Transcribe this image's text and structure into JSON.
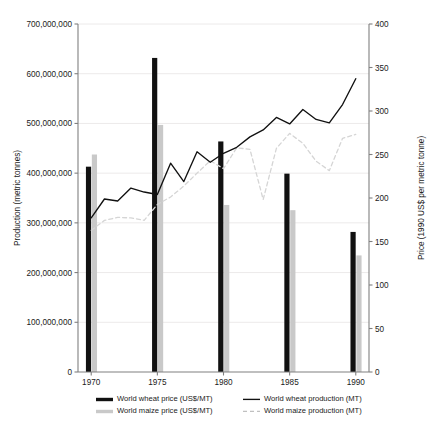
{
  "chart_data": {
    "type": "line",
    "title": "",
    "xlabel": "",
    "ylabel": "Production (metric tonnes)",
    "y2label": "Price (1990 US$ per metric tonne)",
    "xlim": [
      1969,
      1991
    ],
    "ylim": [
      0,
      700000000
    ],
    "y2lim": [
      0,
      400
    ],
    "grid": true,
    "legend_position": "bottom",
    "x_ticks": [
      1970,
      1975,
      1980,
      1985,
      1990
    ],
    "x_tick_labels": [
      "1970",
      "1975",
      "1980",
      "1985",
      "1990"
    ],
    "y_ticks": [
      0,
      100000000,
      200000000,
      300000000,
      400000000,
      500000000,
      600000000,
      700000000
    ],
    "y_tick_labels": [
      "0",
      "100,000,000",
      "200,000,000",
      "300,000,000",
      "400,000,000",
      "500,000,000",
      "600,000,000",
      "700,000,000"
    ],
    "y2_ticks": [
      0,
      50,
      100,
      150,
      200,
      250,
      300,
      350,
      400
    ],
    "y2_tick_labels": [
      "0",
      "50",
      "100",
      "150",
      "200",
      "250",
      "300",
      "350",
      "400"
    ],
    "series": [
      {
        "name": "World wheat price (US$/MT)",
        "type": "bar",
        "axis": "right",
        "color": "#111111",
        "x": [
          1970,
          1975,
          1980,
          1985,
          1990
        ],
        "values": [
          236,
          361,
          265,
          228,
          161
        ]
      },
      {
        "name": "World maize price (US$/MT)",
        "type": "bar",
        "axis": "right",
        "color": "#c9c9c9",
        "x": [
          1970,
          1975,
          1980,
          1985,
          1990
        ],
        "values": [
          250,
          284,
          192,
          186,
          134
        ]
      },
      {
        "name": "World wheat production (MT)",
        "type": "line",
        "axis": "left",
        "color": "#111111",
        "dash": "solid",
        "x": [
          1970,
          1971,
          1972,
          1973,
          1974,
          1975,
          1976,
          1977,
          1978,
          1979,
          1980,
          1981,
          1982,
          1983,
          1984,
          1985,
          1986,
          1987,
          1988,
          1989,
          1990
        ],
        "values": [
          310000000,
          348000000,
          344000000,
          370000000,
          362000000,
          357000000,
          420000000,
          383000000,
          443000000,
          422000000,
          440000000,
          452000000,
          473000000,
          487000000,
          512000000,
          499000000,
          528000000,
          508000000,
          501000000,
          538000000,
          590000000
        ]
      },
      {
        "name": "World maize production (MT)",
        "type": "line",
        "axis": "left",
        "color": "#d5d5d5",
        "dash": "dashed",
        "x": [
          1970,
          1971,
          1972,
          1973,
          1974,
          1975,
          1976,
          1977,
          1978,
          1979,
          1980,
          1981,
          1982,
          1983,
          1984,
          1985,
          1986,
          1987,
          1988,
          1989,
          1990
        ],
        "values": [
          285000000,
          305000000,
          311000000,
          310000000,
          305000000,
          337000000,
          352000000,
          374000000,
          400000000,
          425000000,
          409000000,
          451000000,
          448000000,
          347000000,
          450000000,
          480000000,
          460000000,
          424000000,
          405000000,
          470000000,
          478000000
        ]
      }
    ],
    "legend_entries": [
      {
        "label": "World wheat price (US$/MT)",
        "marker": "bar",
        "color": "#111111"
      },
      {
        "label": "World wheat production (MT)",
        "marker": "line",
        "color": "#111111"
      },
      {
        "label": "World maize price (US$/MT)",
        "marker": "bar",
        "color": "#c9c9c9"
      },
      {
        "label": "World maize production (MT)",
        "marker": "dashed-line",
        "color": "#c0c0c0"
      }
    ]
  }
}
